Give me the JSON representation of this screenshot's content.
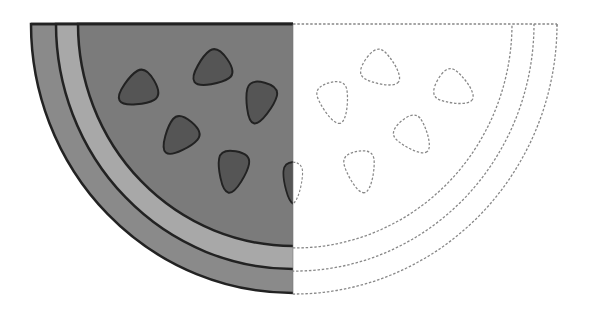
{
  "illustration": {
    "subject": "watermelon slice",
    "style": "half filled grayscale, half dashed outline (symmetry template)",
    "colors": {
      "background": "#ffffff",
      "outer_rind": "#8a8a8a",
      "inner_rind": "#a8a8a8",
      "flesh": "#7b7b7b",
      "seed": "#555555",
      "stroke": "#222222",
      "dashed_stroke": "#888888"
    },
    "geometry": {
      "center_x": 293,
      "top_y": 24,
      "arcs": [
        {
          "name": "outer-rind-edge",
          "rx": 262,
          "ry": 269
        },
        {
          "name": "inner-rind-edge",
          "rx": 237,
          "ry": 245
        },
        {
          "name": "flesh-edge",
          "rx": 215,
          "ry": 222
        }
      ]
    },
    "seeds": [
      {
        "cx": 136,
        "cy": 91,
        "rot": -130
      },
      {
        "cx": 210,
        "cy": 71,
        "rot": -130
      },
      {
        "cx": 259,
        "cy": 104,
        "rot": -170
      },
      {
        "cx": 178,
        "cy": 138,
        "rot": -140
      },
      {
        "cx": 232,
        "cy": 173,
        "rot": -165
      },
      {
        "cx": 293,
        "cy": 184,
        "rot": -180
      }
    ]
  }
}
